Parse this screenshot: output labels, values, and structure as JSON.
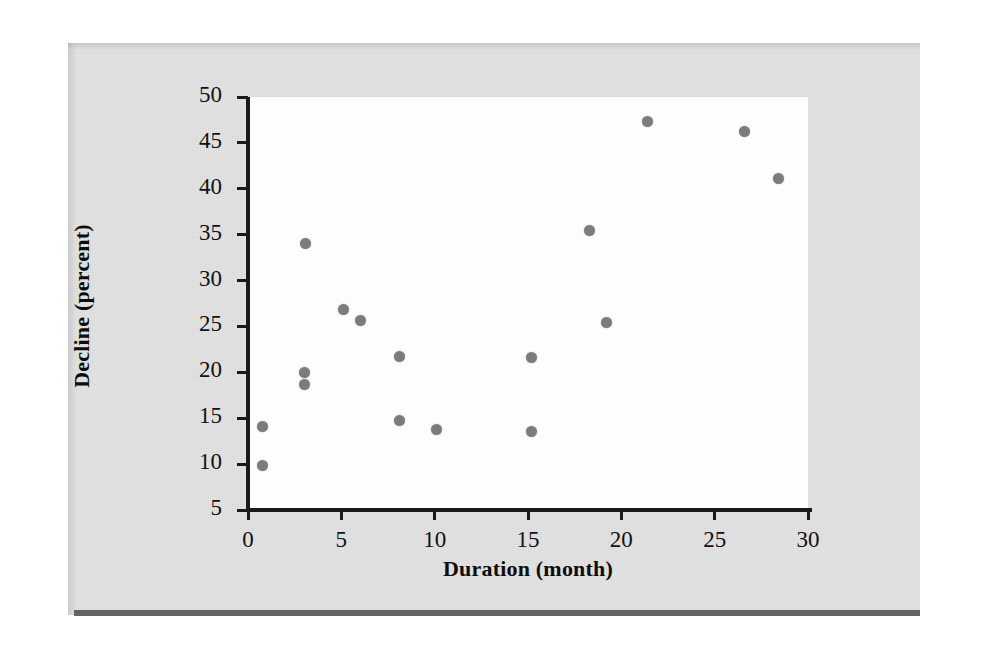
{
  "figure": {
    "background_color": "#e4e4e4",
    "plot_background_color": "#fdfdfd",
    "point_color": "#7c7c7c",
    "axis_color": "#1a1a1a",
    "rule_color": "#646464"
  },
  "chart_data": {
    "type": "scatter",
    "title": "",
    "xlabel": "Duration (month)",
    "ylabel": "Decline (percent)",
    "xlim": [
      0,
      30
    ],
    "ylim": [
      5,
      50
    ],
    "xticks": [
      0,
      5,
      10,
      15,
      20,
      25,
      30
    ],
    "yticks": [
      5,
      10,
      15,
      20,
      25,
      30,
      35,
      40,
      45,
      50
    ],
    "xtick_labels": [
      "0",
      "5",
      "10",
      "15",
      "20",
      "25",
      "30"
    ],
    "ytick_labels": [
      "5",
      "10",
      "15",
      "20",
      "25",
      "30",
      "35",
      "40",
      "45",
      "50"
    ],
    "grid": false,
    "legend": false,
    "marker": "circle",
    "points": [
      {
        "x": 0.8,
        "y": 14.1
      },
      {
        "x": 0.8,
        "y": 9.9
      },
      {
        "x": 3.1,
        "y": 34.0
      },
      {
        "x": 3.0,
        "y": 20.0
      },
      {
        "x": 3.0,
        "y": 18.7
      },
      {
        "x": 5.1,
        "y": 26.8
      },
      {
        "x": 6.0,
        "y": 25.6
      },
      {
        "x": 8.1,
        "y": 21.7
      },
      {
        "x": 8.1,
        "y": 14.8
      },
      {
        "x": 10.1,
        "y": 13.8
      },
      {
        "x": 15.2,
        "y": 21.6
      },
      {
        "x": 15.2,
        "y": 13.6
      },
      {
        "x": 18.3,
        "y": 35.4
      },
      {
        "x": 19.2,
        "y": 25.4
      },
      {
        "x": 21.4,
        "y": 47.3
      },
      {
        "x": 26.6,
        "y": 46.2
      },
      {
        "x": 28.4,
        "y": 41.1
      }
    ]
  }
}
